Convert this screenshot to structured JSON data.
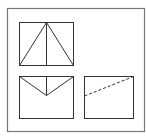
{
  "diagram": {
    "type": "three-view orthographic projection",
    "colors": {
      "stroke": "#333333",
      "frame": "#777777",
      "background": "#ffffff"
    },
    "frame": {
      "x": 7.5,
      "y": 8.5,
      "w": 137,
      "h": 123
    },
    "views": [
      {
        "name": "front-view",
        "box": {
          "x": 19.5,
          "y": 22.5,
          "w": 54,
          "h": 43
        },
        "lines": [
          {
            "x1": 46.5,
            "y1": 22.5,
            "x2": 19.5,
            "y2": 65.5,
            "style": "solid"
          },
          {
            "x1": 46.5,
            "y1": 22.5,
            "x2": 73.5,
            "y2": 65.5,
            "style": "solid"
          },
          {
            "x1": 46.5,
            "y1": 22.5,
            "x2": 46.5,
            "y2": 65.5,
            "style": "solid"
          }
        ]
      },
      {
        "name": "top-view",
        "box": {
          "x": 19.5,
          "y": 76.5,
          "w": 54,
          "h": 42
        },
        "lines": [
          {
            "x1": 19.5,
            "y1": 76.5,
            "x2": 46.5,
            "y2": 95.5,
            "style": "solid"
          },
          {
            "x1": 73.5,
            "y1": 76.5,
            "x2": 46.5,
            "y2": 95.5,
            "style": "solid"
          },
          {
            "x1": 46.5,
            "y1": 76.5,
            "x2": 46.5,
            "y2": 95.5,
            "style": "solid"
          }
        ]
      },
      {
        "name": "side-view",
        "box": {
          "x": 84.5,
          "y": 76.5,
          "w": 49,
          "h": 42
        },
        "lines": [
          {
            "x1": 84.5,
            "y1": 96,
            "x2": 133.5,
            "y2": 76.5,
            "style": "dashed"
          }
        ]
      }
    ]
  }
}
